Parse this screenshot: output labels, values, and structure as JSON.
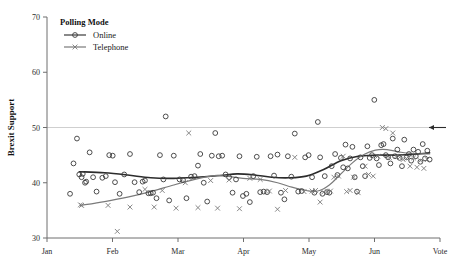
{
  "chart_data": {
    "type": "scatter",
    "title": "",
    "xlabel": "",
    "ylabel": "Brexit Support",
    "ylim": [
      30,
      70
    ],
    "yticks": [
      30,
      40,
      50,
      60,
      70
    ],
    "xticks": [
      "Jan",
      "Feb",
      "Mar",
      "Apr",
      "May",
      "Jun",
      "Vote"
    ],
    "grid": false,
    "reference_line": {
      "y": 50,
      "color": "#cfcfcf"
    },
    "annotation": {
      "name": "left-arrow",
      "y": 50,
      "x_label": "Vote"
    },
    "legend": {
      "title": "Polling Mode",
      "position": "top-left",
      "entries": [
        {
          "name": "Online",
          "marker": "circle",
          "color": "#3a3a3a"
        },
        {
          "name": "Telephone",
          "marker": "cross",
          "color": "#7a7a7a"
        }
      ]
    },
    "series": [
      {
        "name": "Online",
        "marker": "circle",
        "color": "#3a3a3a",
        "points": [
          [
            0.4,
            38.0
          ],
          [
            0.46,
            43.5
          ],
          [
            0.52,
            48.0
          ],
          [
            0.56,
            41.5
          ],
          [
            0.6,
            41.0
          ],
          [
            0.62,
            41.6
          ],
          [
            0.66,
            40.0
          ],
          [
            0.68,
            40.2
          ],
          [
            0.74,
            45.5
          ],
          [
            0.8,
            41.0
          ],
          [
            0.86,
            38.4
          ],
          [
            0.96,
            40.9
          ],
          [
            1.02,
            41.2
          ],
          [
            1.08,
            45.0
          ],
          [
            1.14,
            44.9
          ],
          [
            1.18,
            40.1
          ],
          [
            1.26,
            38.0
          ],
          [
            1.34,
            41.5
          ],
          [
            1.44,
            45.2
          ],
          [
            1.52,
            40.1
          ],
          [
            1.6,
            38.3
          ],
          [
            1.66,
            40.2
          ],
          [
            1.7,
            40.4
          ],
          [
            1.76,
            38.1
          ],
          [
            1.8,
            38.1
          ],
          [
            1.84,
            38.2
          ],
          [
            1.9,
            37.2
          ],
          [
            1.96,
            45.0
          ],
          [
            2.02,
            40.6
          ],
          [
            2.06,
            52.0
          ],
          [
            2.12,
            36.8
          ],
          [
            2.2,
            44.9
          ],
          [
            2.3,
            40.6
          ],
          [
            2.36,
            40.5
          ],
          [
            2.42,
            37.2
          ],
          [
            2.5,
            41.1
          ],
          [
            2.56,
            41.2
          ],
          [
            2.62,
            43.1
          ],
          [
            2.66,
            45.2
          ],
          [
            2.72,
            40.0
          ],
          [
            2.78,
            36.6
          ],
          [
            2.86,
            44.9
          ],
          [
            2.92,
            49.0
          ],
          [
            2.98,
            44.8
          ],
          [
            3.04,
            44.9
          ],
          [
            3.1,
            41.5
          ],
          [
            3.16,
            41.0
          ],
          [
            3.22,
            38.2
          ],
          [
            3.28,
            40.6
          ],
          [
            3.34,
            44.8
          ],
          [
            3.4,
            37.6
          ],
          [
            3.46,
            38.0
          ],
          [
            3.52,
            36.5
          ],
          [
            3.58,
            41.2
          ],
          [
            3.64,
            44.7
          ],
          [
            3.7,
            38.3
          ],
          [
            3.76,
            38.4
          ],
          [
            3.82,
            38.3
          ],
          [
            3.88,
            44.8
          ],
          [
            3.94,
            41.3
          ],
          [
            4.0,
            45.1
          ],
          [
            4.06,
            38.2
          ],
          [
            4.12,
            37.0
          ],
          [
            4.18,
            44.8
          ],
          [
            4.24,
            41.1
          ],
          [
            4.3,
            48.9
          ],
          [
            4.36,
            38.4
          ],
          [
            4.42,
            38.5
          ],
          [
            4.48,
            44.6
          ],
          [
            4.54,
            45.0
          ],
          [
            4.6,
            41.0
          ],
          [
            4.64,
            38.2
          ],
          [
            4.7,
            51.0
          ],
          [
            4.74,
            44.6
          ],
          [
            4.78,
            38.0
          ],
          [
            4.82,
            41.2
          ],
          [
            4.86,
            38.3
          ],
          [
            4.9,
            38.2
          ],
          [
            4.94,
            43.0
          ],
          [
            5.0,
            45.2
          ],
          [
            5.04,
            41.4
          ],
          [
            5.1,
            44.5
          ],
          [
            5.14,
            42.8
          ],
          [
            5.18,
            46.9
          ],
          [
            5.22,
            42.6
          ],
          [
            5.26,
            44.4
          ],
          [
            5.3,
            46.5
          ],
          [
            5.34,
            41.0
          ],
          [
            5.38,
            38.4
          ],
          [
            5.44,
            44.6
          ],
          [
            5.48,
            43.0
          ],
          [
            5.52,
            41.2
          ],
          [
            5.56,
            46.6
          ],
          [
            5.6,
            44.5
          ],
          [
            5.64,
            45.0
          ],
          [
            5.68,
            55.0
          ],
          [
            5.72,
            44.4
          ],
          [
            5.76,
            43.2
          ],
          [
            5.8,
            46.8
          ],
          [
            5.84,
            47.0
          ],
          [
            5.88,
            45.0
          ],
          [
            5.92,
            44.6
          ],
          [
            5.96,
            43.5
          ],
          [
            6.0,
            48.0
          ],
          [
            6.04,
            44.8
          ],
          [
            6.08,
            46.0
          ],
          [
            6.12,
            44.5
          ],
          [
            6.16,
            43.0
          ],
          [
            6.2,
            47.8
          ],
          [
            6.24,
            44.6
          ],
          [
            6.28,
            45.2
          ],
          [
            6.32,
            44.0
          ],
          [
            6.36,
            46.0
          ],
          [
            6.4,
            44.8
          ],
          [
            6.44,
            45.6
          ],
          [
            6.48,
            43.8
          ],
          [
            6.52,
            47.0
          ],
          [
            6.56,
            44.4
          ],
          [
            6.6,
            45.8
          ],
          [
            6.64,
            44.2
          ]
        ]
      },
      {
        "name": "Telephone",
        "marker": "cross",
        "color": "#7a7a7a",
        "points": [
          [
            0.58,
            36.0
          ],
          [
            0.6,
            35.9
          ],
          [
            1.06,
            35.9
          ],
          [
            1.22,
            31.2
          ],
          [
            1.44,
            35.6
          ],
          [
            1.7,
            38.8
          ],
          [
            1.86,
            35.6
          ],
          [
            2.0,
            38.6
          ],
          [
            2.24,
            35.4
          ],
          [
            2.4,
            40.0
          ],
          [
            2.46,
            49.0
          ],
          [
            2.62,
            35.5
          ],
          [
            2.84,
            40.4
          ],
          [
            2.96,
            35.4
          ],
          [
            3.16,
            40.5
          ],
          [
            3.34,
            35.3
          ],
          [
            3.52,
            40.8
          ],
          [
            3.7,
            40.6
          ],
          [
            3.86,
            38.5
          ],
          [
            4.0,
            35.2
          ],
          [
            4.14,
            38.6
          ],
          [
            4.3,
            44.6
          ],
          [
            4.46,
            38.4
          ],
          [
            4.6,
            38.5
          ],
          [
            4.66,
            38.6
          ],
          [
            4.74,
            36.5
          ],
          [
            4.8,
            38.3
          ],
          [
            4.86,
            38.4
          ],
          [
            4.92,
            38.5
          ],
          [
            4.98,
            41.0
          ],
          [
            5.06,
            41.2
          ],
          [
            5.14,
            44.8
          ],
          [
            5.2,
            38.4
          ],
          [
            5.26,
            38.6
          ],
          [
            5.32,
            41.0
          ],
          [
            5.4,
            38.2
          ],
          [
            5.52,
            43.0
          ],
          [
            5.58,
            41.5
          ],
          [
            5.66,
            41.2
          ],
          [
            5.74,
            44.8
          ],
          [
            5.82,
            50.0
          ],
          [
            5.88,
            49.8
          ],
          [
            5.94,
            44.6
          ],
          [
            6.0,
            49.0
          ],
          [
            6.06,
            44.8
          ],
          [
            6.12,
            44.6
          ],
          [
            6.18,
            44.2
          ],
          [
            6.24,
            44.4
          ],
          [
            6.3,
            43.0
          ],
          [
            6.36,
            44.5
          ],
          [
            6.42,
            42.8
          ],
          [
            6.48,
            44.0
          ],
          [
            6.54,
            42.6
          ],
          [
            6.6,
            44.2
          ]
        ]
      }
    ],
    "trend_lines": [
      {
        "name": "Online",
        "color": "#2c2c2c",
        "width": 1.6,
        "points": [
          [
            0.56,
            42.0
          ],
          [
            1.0,
            41.8
          ],
          [
            1.4,
            41.4
          ],
          [
            1.8,
            40.9
          ],
          [
            2.2,
            40.8
          ],
          [
            2.6,
            41.0
          ],
          [
            3.0,
            41.3
          ],
          [
            3.3,
            41.6
          ],
          [
            3.6,
            41.4
          ],
          [
            3.9,
            41.0
          ],
          [
            4.2,
            40.9
          ],
          [
            4.5,
            41.2
          ],
          [
            4.8,
            42.4
          ],
          [
            5.1,
            44.0
          ],
          [
            5.4,
            44.8
          ],
          [
            5.7,
            45.0
          ],
          [
            6.0,
            45.0
          ],
          [
            6.3,
            45.1
          ],
          [
            6.64,
            45.4
          ]
        ]
      },
      {
        "name": "Telephone",
        "color": "#7a7a7a",
        "width": 1.2,
        "points": [
          [
            0.58,
            35.9
          ],
          [
            1.0,
            36.6
          ],
          [
            1.4,
            37.4
          ],
          [
            1.8,
            38.4
          ],
          [
            2.2,
            39.6
          ],
          [
            2.6,
            40.7
          ],
          [
            2.9,
            41.3
          ],
          [
            3.1,
            41.2
          ],
          [
            3.4,
            40.8
          ],
          [
            3.7,
            40.6
          ],
          [
            4.0,
            40.0
          ],
          [
            4.25,
            39.2
          ],
          [
            4.5,
            38.6
          ],
          [
            4.7,
            38.5
          ],
          [
            4.9,
            39.6
          ],
          [
            5.1,
            41.6
          ],
          [
            5.3,
            43.6
          ],
          [
            5.5,
            45.1
          ],
          [
            5.7,
            45.9
          ],
          [
            5.9,
            46.0
          ],
          [
            6.1,
            45.6
          ],
          [
            6.3,
            45.3
          ],
          [
            6.64,
            45.2
          ]
        ]
      }
    ]
  }
}
